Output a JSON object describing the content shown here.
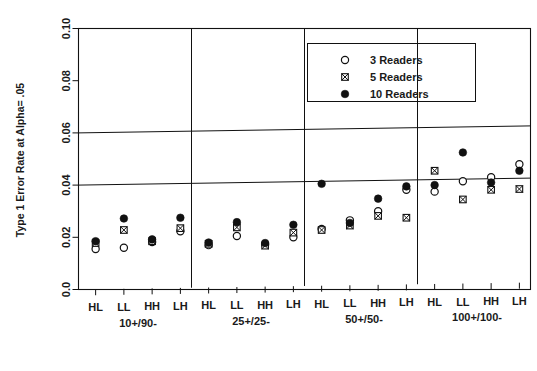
{
  "chart_data": {
    "type": "scatter",
    "title": "",
    "xlabel": "",
    "ylabel": "Type 1 Error Rate at Alpha= .05",
    "ylim": [
      0.0,
      0.1
    ],
    "yticks": [
      "0.0",
      "0.02",
      "0.04",
      "0.06",
      "0.08",
      "0.10"
    ],
    "ytick_values": [
      0.0,
      0.02,
      0.04,
      0.06,
      0.08,
      0.1
    ],
    "gridlines": [
      0.04,
      0.06
    ],
    "grid": true,
    "legend_position": "top-right",
    "groups": [
      "10+/90-",
      "25+/25-",
      "50+/50-",
      "100+/100-"
    ],
    "categories": [
      "HL",
      "LL",
      "HH",
      "LH",
      "HL",
      "LL",
      "HH",
      "LH",
      "HL",
      "LL",
      "HH",
      "LH",
      "HL",
      "LL",
      "HH",
      "LH"
    ],
    "x": [
      {
        "group": "10+/90-",
        "label": "HL"
      },
      {
        "group": "10+/90-",
        "label": "LL"
      },
      {
        "group": "10+/90-",
        "label": "HH"
      },
      {
        "group": "10+/90-",
        "label": "LH"
      },
      {
        "group": "25+/25-",
        "label": "HL"
      },
      {
        "group": "25+/25-",
        "label": "LL"
      },
      {
        "group": "25+/25-",
        "label": "HH"
      },
      {
        "group": "25+/25-",
        "label": "LH"
      },
      {
        "group": "50+/50-",
        "label": "HL"
      },
      {
        "group": "50+/50-",
        "label": "LL"
      },
      {
        "group": "50+/50-",
        "label": "HH"
      },
      {
        "group": "50+/50-",
        "label": "LH"
      },
      {
        "group": "100+/100-",
        "label": "HL"
      },
      {
        "group": "100+/100-",
        "label": "LL"
      },
      {
        "group": "100+/100-",
        "label": "HH"
      },
      {
        "group": "100+/100-",
        "label": "LH"
      }
    ],
    "series": [
      {
        "name": "3 Readers",
        "marker": "open-circle",
        "values": [
          0.0155,
          0.016,
          0.0182,
          0.0223,
          0.017,
          0.0205,
          0.0172,
          0.02,
          0.0232,
          0.0265,
          0.03,
          0.0382,
          0.0375,
          0.0415,
          0.043,
          0.048
        ]
      },
      {
        "name": "5 Readers",
        "marker": "crossed-square",
        "values": [
          0.0178,
          0.0228,
          0.0185,
          0.0235,
          0.0175,
          0.0238,
          0.0168,
          0.0218,
          0.0228,
          0.0245,
          0.0282,
          0.0275,
          0.0455,
          0.0345,
          0.0382,
          0.0385
        ]
      },
      {
        "name": "10 Readers",
        "marker": "filled-circle",
        "values": [
          0.0185,
          0.0272,
          0.0192,
          0.0275,
          0.018,
          0.0258,
          0.0178,
          0.0248,
          0.0405,
          0.0255,
          0.0348,
          0.0395,
          0.04,
          0.0525,
          0.041,
          0.0455
        ]
      }
    ],
    "legend": [
      {
        "label": "3 Readers",
        "marker": "open-circle"
      },
      {
        "label": "5 Readers",
        "marker": "crossed-square"
      },
      {
        "label": "10 Readers",
        "marker": "filled-circle"
      }
    ],
    "colors": {
      "marker": "#111111",
      "axis": "#111111",
      "background": "#ffffff"
    }
  }
}
